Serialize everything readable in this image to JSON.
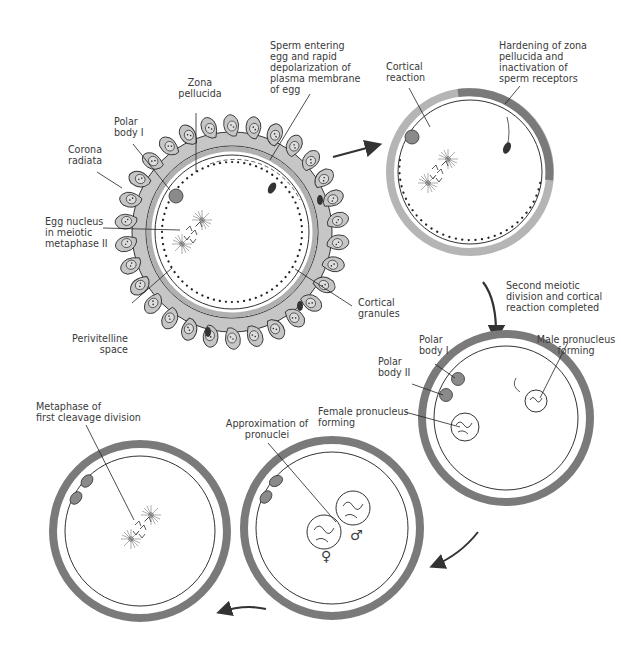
{
  "diagram": {
    "colors": {
      "zona_dark": "#7a7a7a",
      "zona_light": "#b5b5b5",
      "corona": "#c6c6c6",
      "outline": "#2b2b2b",
      "text": "#3a3a3a",
      "arrow": "#333333"
    },
    "stages": [
      {
        "id": "sperm-penetration",
        "labels": {
          "sperm_entering": "Sperm entering\negg and rapid\ndepolarization of\nplasma membrane\nof egg",
          "zona_pellucida": "Zona\npellucida",
          "polar_body_1": "Polar\nbody I",
          "corona_radiata": "Corona\nradiata",
          "egg_nucleus": "Egg nucleus\nin meiotic\nmetaphase II",
          "perivitelline_space": "Perivitelline\nspace",
          "cortical_granules": "Cortical\ngranules"
        }
      },
      {
        "id": "cortical-reaction",
        "labels": {
          "cortical_reaction": "Cortical\nreaction",
          "hardening": "Hardening of zona\npellucida and\ninactivation of\nsperm receptors"
        }
      },
      {
        "id": "pronuclei-forming",
        "transition_label": "Second meiotic\ndivision and cortical\nreaction completed",
        "labels": {
          "polar_body_1": "Polar\nbody I",
          "polar_body_2": "Polar\nbody II",
          "male_pronucleus": "Male pronucleus\nforming",
          "female_pronucleus": "Female pronucleus\nforming"
        }
      },
      {
        "id": "approximation",
        "labels": {
          "approximation": "Approximation of\npronuclei",
          "female_symbol": "♀",
          "male_symbol": "♂"
        }
      },
      {
        "id": "first-cleavage",
        "labels": {
          "metaphase": "Metaphase of\nfirst cleavage division"
        }
      }
    ]
  }
}
